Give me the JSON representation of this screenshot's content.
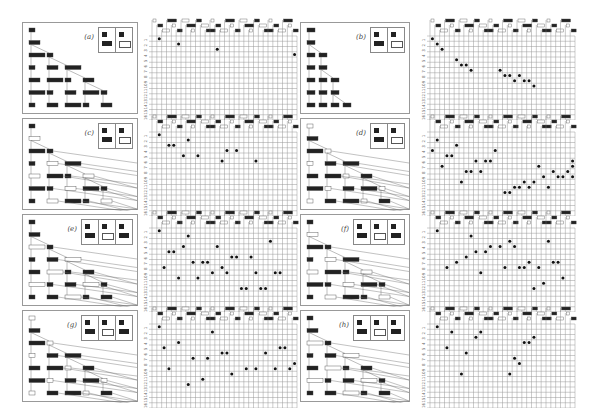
{
  "figure": {
    "panels": [
      {
        "label": "(a)",
        "rule_cells": 2,
        "dots": [
          [
            1,
            2
          ],
          [
            2,
            6
          ],
          [
            3,
            14
          ],
          [
            4,
            30
          ]
        ]
      },
      {
        "label": "(b)",
        "rule_cells": 2,
        "dots": [
          [
            1,
            1
          ],
          [
            2,
            2
          ],
          [
            3,
            3
          ],
          [
            5,
            6
          ],
          [
            6,
            7
          ],
          [
            6,
            8
          ],
          [
            7,
            9
          ],
          [
            7,
            15
          ],
          [
            8,
            16
          ],
          [
            8,
            17
          ],
          [
            9,
            18
          ],
          [
            8,
            19
          ],
          [
            9,
            20
          ],
          [
            9,
            21
          ],
          [
            10,
            22
          ]
        ]
      },
      {
        "label": "(c)",
        "rule_cells": 2,
        "dots": [
          [
            1,
            2
          ],
          [
            3,
            4
          ],
          [
            3,
            5
          ],
          [
            2,
            8
          ],
          [
            5,
            7
          ],
          [
            5,
            10
          ],
          [
            4,
            16
          ],
          [
            4,
            18
          ],
          [
            6,
            15
          ],
          [
            6,
            22
          ]
        ]
      },
      {
        "label": "(d)",
        "rule_cells": 2,
        "dots": [
          [
            2,
            2
          ],
          [
            4,
            1
          ],
          [
            5,
            4
          ],
          [
            5,
            5
          ],
          [
            3,
            6
          ],
          [
            7,
            3
          ],
          [
            8,
            8
          ],
          [
            8,
            9
          ],
          [
            6,
            10
          ],
          [
            6,
            12
          ],
          [
            6,
            13
          ],
          [
            4,
            14
          ],
          [
            10,
            7
          ],
          [
            8,
            11
          ],
          [
            12,
            17
          ],
          [
            12,
            16
          ],
          [
            11,
            18
          ],
          [
            11,
            19
          ],
          [
            10,
            20
          ],
          [
            11,
            21
          ],
          [
            10,
            22
          ],
          [
            7,
            23
          ],
          [
            9,
            24
          ],
          [
            11,
            25
          ],
          [
            8,
            26
          ],
          [
            9,
            27
          ],
          [
            9,
            28
          ],
          [
            8,
            29
          ],
          [
            9,
            30
          ],
          [
            7,
            31
          ],
          [
            6,
            32
          ]
        ]
      },
      {
        "label": "(e)",
        "rule_cells": 3,
        "dots": [
          [
            1,
            2
          ],
          [
            5,
            4
          ],
          [
            5,
            5
          ],
          [
            8,
            3
          ],
          [
            10,
            6
          ],
          [
            4,
            7
          ],
          [
            7,
            9
          ],
          [
            2,
            8
          ],
          [
            10,
            10
          ],
          [
            7,
            11
          ],
          [
            7,
            12
          ],
          [
            9,
            13
          ],
          [
            4,
            14
          ],
          [
            8,
            15
          ],
          [
            9,
            16
          ],
          [
            6,
            17
          ],
          [
            6,
            18
          ],
          [
            12,
            19
          ],
          [
            12,
            20
          ],
          [
            6,
            21
          ],
          [
            9,
            22
          ],
          [
            12,
            23
          ],
          [
            12,
            24
          ],
          [
            3,
            25
          ],
          [
            9,
            26
          ],
          [
            9,
            27
          ]
        ]
      },
      {
        "label": "(f)",
        "rule_cells": 3,
        "dots": [
          [
            1,
            2
          ],
          [
            8,
            4
          ],
          [
            7,
            6
          ],
          [
            6,
            8
          ],
          [
            2,
            9
          ],
          [
            5,
            10
          ],
          [
            5,
            12
          ],
          [
            9,
            11
          ],
          [
            4,
            13
          ],
          [
            4,
            15
          ],
          [
            8,
            16
          ],
          [
            3,
            17
          ],
          [
            4,
            18
          ],
          [
            8,
            19
          ],
          [
            8,
            20
          ],
          [
            7,
            21
          ],
          [
            12,
            22
          ],
          [
            8,
            23
          ],
          [
            11,
            24
          ],
          [
            3,
            25
          ],
          [
            7,
            26
          ],
          [
            7,
            27
          ],
          [
            10,
            28
          ]
        ]
      },
      {
        "label": "(g)",
        "rule_cells": 3,
        "dots": [
          [
            1,
            2
          ],
          [
            5,
            3
          ],
          [
            9,
            4
          ],
          [
            12,
            8
          ],
          [
            4,
            6
          ],
          [
            7,
            9
          ],
          [
            2,
            13
          ],
          [
            11,
            11
          ],
          [
            6,
            16
          ],
          [
            7,
            12
          ],
          [
            10,
            17
          ],
          [
            6,
            15
          ],
          [
            9,
            20
          ],
          [
            9,
            22
          ],
          [
            6,
            24
          ],
          [
            9,
            26
          ],
          [
            5,
            27
          ],
          [
            5,
            28
          ],
          [
            9,
            29
          ],
          [
            8,
            30
          ]
        ]
      },
      {
        "label": "(h)",
        "rule_cells": 3,
        "dots": [
          [
            1,
            2
          ],
          [
            2,
            5
          ],
          [
            5,
            4
          ],
          [
            10,
            7
          ],
          [
            6,
            8
          ],
          [
            3,
            10
          ],
          [
            2,
            11
          ],
          [
            10,
            17
          ],
          [
            7,
            18
          ],
          [
            8,
            19
          ],
          [
            4,
            20
          ],
          [
            4,
            21
          ],
          [
            3,
            22
          ]
        ]
      }
    ],
    "grid": {
      "rows": 16,
      "cols": 30,
      "row_labels": [
        "1",
        "2",
        "3",
        "4",
        "5",
        "6",
        "7",
        "8",
        "9",
        "10",
        "11",
        "12",
        "13",
        "14",
        "15",
        "16"
      ]
    }
  }
}
